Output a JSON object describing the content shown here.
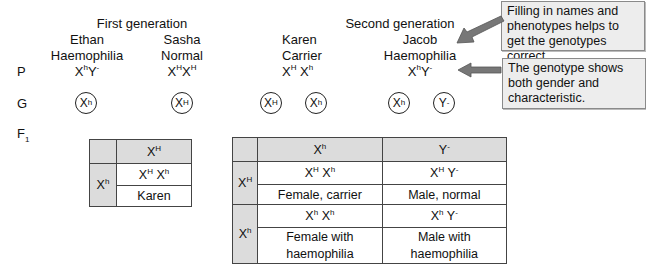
{
  "header": {
    "first_generation": "First generation",
    "second_generation": "Second generation"
  },
  "row_labels": {
    "parents": "P",
    "gametes": "G",
    "offspring": "F",
    "offspring_sub": "1"
  },
  "people": [
    {
      "name": "Ethan",
      "phenotype": "Haemophilia",
      "genotype": [
        {
          "base": "X",
          "sup": "h"
        },
        {
          "base": "Y",
          "sup": "-"
        }
      ]
    },
    {
      "name": "Sasha",
      "phenotype": "Normal",
      "genotype": [
        {
          "base": "X",
          "sup": "H"
        },
        {
          "base": "X",
          "sup": "H"
        }
      ]
    },
    {
      "name": "Karen",
      "phenotype": "Carrier",
      "genotype": [
        {
          "base": "X",
          "sup": "H"
        },
        {
          "base": "X",
          "sup": "h"
        }
      ]
    },
    {
      "name": "Jacob",
      "phenotype": "Haemophilia",
      "genotype": [
        {
          "base": "X",
          "sup": "h"
        },
        {
          "base": "Y",
          "sup": "-"
        }
      ]
    }
  ],
  "gametes": [
    {
      "base": "X",
      "sup": "h"
    },
    {
      "base": "X",
      "sup": "H"
    },
    {
      "base": "X",
      "sup": "H"
    },
    {
      "base": "X",
      "sup": "h"
    },
    {
      "base": "X",
      "sup": "h"
    },
    {
      "base": "Y",
      "sup": "-"
    }
  ],
  "notes": [
    {
      "text": "Filling in names and phenotypes helps to get the genotypes correct."
    },
    {
      "text": "The genotype shows both gender and characteristic."
    }
  ],
  "punnett_small": {
    "col_header": {
      "base": "X",
      "sup": "H"
    },
    "row_header": {
      "base": "X",
      "sup": "h"
    },
    "cell_genotype": "XH Xh",
    "cell_label": "Karen"
  },
  "punnett_large": {
    "col_headers": [
      {
        "base": "X",
        "sup": "h"
      },
      {
        "base": "Y",
        "sup": "-"
      }
    ],
    "row_headers": [
      {
        "base": "X",
        "sup": "H"
      },
      {
        "base": "X",
        "sup": "h"
      }
    ],
    "cells": [
      [
        {
          "genotype": "XH Xh",
          "label": "Female, carrier"
        },
        {
          "genotype": "XH Y-",
          "label": "Male, normal"
        }
      ],
      [
        {
          "genotype": "Xh Xh",
          "label": "Female with haemophilia"
        },
        {
          "genotype": "Xh Y-",
          "label": "Male with haemophilia"
        }
      ]
    ]
  },
  "colors": {
    "note_bg": "#ededed",
    "note_border": "#8a8a8a",
    "arrow": "#777777",
    "table_shade": "#dcdcdc"
  }
}
